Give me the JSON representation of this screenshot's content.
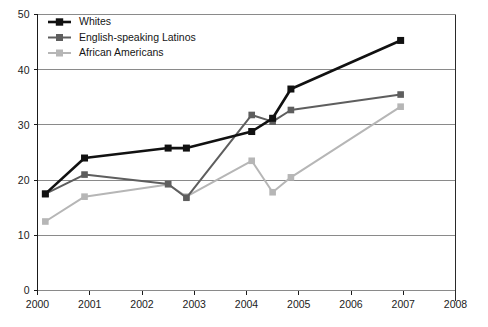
{
  "chart_data": {
    "type": "line",
    "title": "",
    "subtitle": "",
    "xlabel": "",
    "ylabel": "",
    "xlim": [
      2000,
      2008
    ],
    "ylim": [
      0,
      50
    ],
    "grid": true,
    "legend_position": "top-left",
    "x_ticks": [
      "2000",
      "2001",
      "2002",
      "2003",
      "2004",
      "2005",
      "2006",
      "2007",
      "2008"
    ],
    "x_tick_values": [
      2000,
      2001,
      2002,
      2003,
      2004,
      2005,
      2006,
      2007,
      2008
    ],
    "y_ticks": [
      "0",
      "10",
      "20",
      "30",
      "40",
      "50"
    ],
    "y_tick_values": [
      0,
      10,
      20,
      30,
      40,
      50
    ],
    "series": [
      {
        "name": "Whites",
        "color": "#111111",
        "marker": "square",
        "points": [
          {
            "x": 2000.15,
            "y": 17.5
          },
          {
            "x": 2000.9,
            "y": 24.0
          },
          {
            "x": 2002.5,
            "y": 25.8
          },
          {
            "x": 2002.85,
            "y": 25.8
          },
          {
            "x": 2004.1,
            "y": 28.8
          },
          {
            "x": 2004.5,
            "y": 31.2
          },
          {
            "x": 2004.85,
            "y": 36.5
          },
          {
            "x": 2006.95,
            "y": 45.3
          }
        ]
      },
      {
        "name": "English-speaking Latinos",
        "color": "#5e5e5e",
        "marker": "square",
        "points": [
          {
            "x": 2000.15,
            "y": 17.5
          },
          {
            "x": 2000.9,
            "y": 21.0
          },
          {
            "x": 2002.5,
            "y": 19.3
          },
          {
            "x": 2002.85,
            "y": 16.8
          },
          {
            "x": 2004.1,
            "y": 31.8
          },
          {
            "x": 2004.5,
            "y": 30.6
          },
          {
            "x": 2004.85,
            "y": 32.7
          },
          {
            "x": 2006.95,
            "y": 35.5
          }
        ]
      },
      {
        "name": "African Americans",
        "color": "#b6b6b6",
        "marker": "square",
        "points": [
          {
            "x": 2000.15,
            "y": 12.5
          },
          {
            "x": 2000.9,
            "y": 17.0
          },
          {
            "x": 2002.5,
            "y": 19.2
          },
          {
            "x": 2002.85,
            "y": 17.0
          },
          {
            "x": 2004.1,
            "y": 23.5
          },
          {
            "x": 2004.5,
            "y": 17.8
          },
          {
            "x": 2004.85,
            "y": 20.5
          },
          {
            "x": 2006.95,
            "y": 33.3
          }
        ]
      }
    ]
  }
}
